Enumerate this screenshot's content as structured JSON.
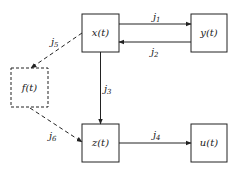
{
  "nodes": [
    {
      "id": "x",
      "label": "x(t)",
      "style": "solid"
    },
    {
      "id": "y",
      "label": "y(t)",
      "style": "solid"
    },
    {
      "id": "f",
      "label": "f(t)",
      "style": "dashed"
    },
    {
      "id": "z",
      "label": "z(t)",
      "style": "solid"
    },
    {
      "id": "u",
      "label": "u(t)",
      "style": "solid"
    }
  ],
  "edges": [
    {
      "id": "j1",
      "label": "j",
      "sub": "1",
      "from": "x",
      "to": "y",
      "style": "solid"
    },
    {
      "id": "j2",
      "label": "j",
      "sub": "2",
      "from": "y",
      "to": "x",
      "style": "solid"
    },
    {
      "id": "j3",
      "label": "j",
      "sub": "3",
      "from": "x",
      "to": "z",
      "style": "solid"
    },
    {
      "id": "j4",
      "label": "j",
      "sub": "4",
      "from": "z",
      "to": "u",
      "style": "solid"
    },
    {
      "id": "j5",
      "label": "j",
      "sub": "5",
      "from": "x",
      "to": "f",
      "style": "dashed"
    },
    {
      "id": "j6",
      "label": "j",
      "sub": "6",
      "from": "f",
      "to": "z",
      "style": "dashed"
    }
  ],
  "colors": {
    "stroke": "#222222",
    "background": "#ffffff"
  }
}
